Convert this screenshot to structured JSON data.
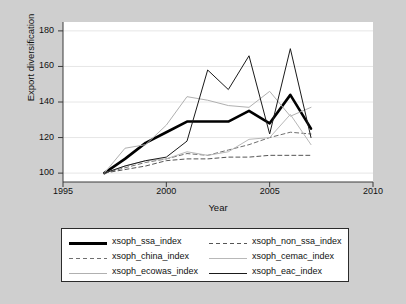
{
  "figure": {
    "background_color": "#cfcfcf",
    "plot_background_color": "#ffffff"
  },
  "axes": {
    "ylabel": "Export diversification",
    "xlabel": "Year",
    "yticks": [
      "100",
      "120",
      "140",
      "160",
      "180"
    ],
    "xticks": [
      "1995",
      "2000",
      "2005",
      "2010"
    ]
  },
  "legend": {
    "left_column": [
      {
        "label": "xsoph_ssa_index",
        "style": "solid-thick-black",
        "color": "#000000"
      },
      {
        "label": "xsoph_china_index",
        "style": "dashed-gray",
        "color": "#6f6f6f"
      },
      {
        "label": "xsoph_ecowas_index",
        "style": "solid-thin-lightgray",
        "color": "#b0b0b0"
      }
    ],
    "right_column": [
      {
        "label": "xsoph_non_ssa_index",
        "style": "dashed-darkgray",
        "color": "#555555"
      },
      {
        "label": "xsoph_cemac_index",
        "style": "solid-thin-lightgray",
        "color": "#b8b8b8"
      },
      {
        "label": "xsoph_eac_index",
        "style": "solid-thin-black",
        "color": "#1a1a1a"
      }
    ]
  },
  "chart_data": {
    "type": "line",
    "title": "",
    "xlabel": "Year",
    "ylabel": "Export diversification",
    "xlim": [
      1995,
      2010
    ],
    "ylim": [
      95,
      185
    ],
    "xticks": [
      1995,
      2000,
      2005,
      2010
    ],
    "yticks": [
      100,
      120,
      140,
      160,
      180
    ],
    "grid": "horizontal",
    "legend_position": "below-plot",
    "x": [
      1997,
      1998,
      1999,
      2000,
      2001,
      2002,
      2003,
      2004,
      2005,
      2006,
      2007
    ],
    "series": [
      {
        "name": "xsoph_ssa_index",
        "style": "solid",
        "width": "thick",
        "color": "#000000",
        "values": [
          100,
          108,
          117,
          123,
          129,
          129,
          129,
          135,
          128,
          144,
          125
        ]
      },
      {
        "name": "xsoph_china_index",
        "style": "dashed",
        "width": "thin",
        "color": "#6f6f6f",
        "values": [
          100,
          103,
          106,
          108,
          111,
          110,
          113,
          116,
          120,
          123,
          122
        ]
      },
      {
        "name": "xsoph_ecowas_index",
        "style": "solid",
        "width": "thin",
        "color": "#b0b0b0",
        "values": [
          100,
          114,
          116,
          127,
          143,
          141,
          138,
          137,
          146,
          132,
          137
        ]
      },
      {
        "name": "xsoph_non_ssa_index",
        "style": "dashed",
        "width": "thin",
        "color": "#555555",
        "values": [
          100,
          102,
          104,
          107,
          108,
          108,
          109,
          109,
          110,
          110,
          110
        ]
      },
      {
        "name": "xsoph_cemac_index",
        "style": "solid",
        "width": "thin",
        "color": "#b8b8b8",
        "values": [
          100,
          104,
          107,
          108,
          112,
          110,
          112,
          119,
          120,
          133,
          116
        ]
      },
      {
        "name": "xsoph_eac_index",
        "style": "solid",
        "width": "thin",
        "color": "#1a1a1a",
        "values": [
          100,
          104,
          107,
          109,
          118,
          158,
          147,
          166,
          122,
          170,
          120
        ]
      }
    ]
  }
}
